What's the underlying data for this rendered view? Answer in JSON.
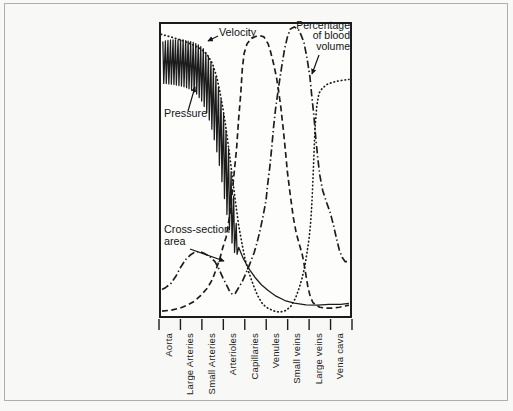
{
  "figure": {
    "ink_color": "#1c1c1c",
    "paper_color": "#f8f8f6",
    "frame_color": "#adadab"
  },
  "annotations": {
    "velocity": "Velocity",
    "pressure": "Pressure",
    "cross_section": "Cross-section\narea",
    "blood_volume": "Percentage\nof blood\nvolume"
  },
  "chart_data": {
    "type": "line",
    "title": "",
    "xlabel": "",
    "ylabel": "",
    "ink": "#1c1c1c",
    "grid": false,
    "legend": "inline text labels with arrows",
    "x_axis": {
      "categories": [
        "Aorta",
        "Large Arteries",
        "Small Arteries",
        "Arterioles",
        "Capillaries",
        "Venules",
        "Small veins",
        "Large veins",
        "Vena cava"
      ],
      "tick_style": "boundary ticks below axis, labels rotated 90deg reading bottom-to-top"
    },
    "y_axis": {
      "range": [
        0,
        100
      ],
      "note": "relative scale, no numeric ticks shown in figure"
    },
    "series": [
      {
        "name": "Velocity",
        "datakey": "velocity",
        "style": "dotted",
        "points": [
          [
            0,
            96.5
          ],
          [
            0.5,
            95.5
          ],
          [
            1,
            94.4
          ],
          [
            1.5,
            92.9
          ],
          [
            1.9,
            91.5
          ],
          [
            2.2,
            89.5
          ],
          [
            2.45,
            86.5
          ],
          [
            2.65,
            82
          ],
          [
            2.8,
            77
          ],
          [
            2.95,
            71
          ],
          [
            3.1,
            64
          ],
          [
            3.25,
            56
          ],
          [
            3.4,
            47.5
          ],
          [
            3.55,
            39
          ],
          [
            3.7,
            31
          ],
          [
            3.85,
            25
          ],
          [
            4,
            19.5
          ],
          [
            4.2,
            14.5
          ],
          [
            4.4,
            10.5
          ],
          [
            4.6,
            7
          ],
          [
            4.85,
            4
          ],
          [
            5.1,
            2.6
          ],
          [
            5.4,
            1.7
          ],
          [
            5.65,
            1.3
          ],
          [
            5.95,
            1.9
          ],
          [
            6.2,
            3.5
          ],
          [
            6.4,
            6
          ],
          [
            6.55,
            9
          ],
          [
            6.7,
            12.5
          ],
          [
            6.85,
            17
          ],
          [
            6.95,
            21.5
          ],
          [
            7.05,
            26.5
          ],
          [
            7.12,
            31.5
          ],
          [
            7.18,
            38
          ],
          [
            7.22,
            44
          ],
          [
            7.26,
            51
          ],
          [
            7.3,
            58
          ],
          [
            7.34,
            65
          ],
          [
            7.42,
            72
          ],
          [
            7.52,
            76.3
          ],
          [
            7.68,
            78
          ],
          [
            7.9,
            79.3
          ],
          [
            8.15,
            80
          ],
          [
            8.45,
            80.5
          ],
          [
            8.95,
            81
          ]
        ]
      },
      {
        "name": "Pressure",
        "datakey": "pressure",
        "style": "solid-oscillating",
        "spikes": 30,
        "envelope_top": [
          [
            0.09,
            94
          ],
          [
            0.5,
            94.6
          ],
          [
            1,
            94.6
          ],
          [
            1.5,
            93.8
          ],
          [
            1.8,
            92.8
          ],
          [
            2.05,
            91.3
          ],
          [
            2.25,
            89
          ],
          [
            2.45,
            86
          ],
          [
            2.6,
            82.5
          ],
          [
            2.75,
            78
          ],
          [
            2.9,
            72.5
          ],
          [
            3.05,
            66
          ],
          [
            3.2,
            58.5
          ],
          [
            3.3,
            52
          ],
          [
            3.42,
            44
          ],
          [
            3.52,
            36.5
          ],
          [
            3.62,
            28.5
          ],
          [
            3.7,
            23.5
          ]
        ],
        "envelope_bottom": [
          [
            0.09,
            79.7
          ],
          [
            0.5,
            79.4
          ],
          [
            1,
            78.7
          ],
          [
            1.4,
            77.7
          ],
          [
            1.7,
            76
          ],
          [
            1.95,
            73.5
          ],
          [
            2.15,
            70.3
          ],
          [
            2.35,
            66
          ],
          [
            2.52,
            61
          ],
          [
            2.68,
            55.5
          ],
          [
            2.82,
            50
          ],
          [
            2.95,
            43.5
          ],
          [
            3.1,
            36.5
          ],
          [
            3.25,
            30
          ],
          [
            3.38,
            25
          ],
          [
            3.5,
            21.8
          ],
          [
            3.65,
            21
          ],
          [
            3.7,
            22.5
          ]
        ],
        "tail": [
          [
            3.7,
            23.5
          ],
          [
            3.9,
            20
          ],
          [
            4.1,
            17.3
          ],
          [
            4.25,
            15.5
          ],
          [
            4.5,
            13
          ],
          [
            4.78,
            10.7
          ],
          [
            5.1,
            8.7
          ],
          [
            5.48,
            6.8
          ],
          [
            5.9,
            5.3
          ],
          [
            6.35,
            4.4
          ],
          [
            6.9,
            3.8
          ],
          [
            7.45,
            3.7
          ],
          [
            8,
            4
          ],
          [
            8.55,
            4
          ],
          [
            8.95,
            4.3
          ]
        ]
      },
      {
        "name": "Cross-section area",
        "datakey": "cross-section-area",
        "style": "dashed",
        "points": [
          [
            0.05,
            1.7
          ],
          [
            0.5,
            2
          ],
          [
            0.9,
            2.7
          ],
          [
            1.25,
            3.7
          ],
          [
            1.6,
            5.1
          ],
          [
            1.9,
            7.1
          ],
          [
            2.2,
            9.5
          ],
          [
            2.45,
            12.5
          ],
          [
            2.6,
            15.5
          ],
          [
            2.8,
            19.6
          ],
          [
            2.95,
            23.6
          ],
          [
            3.1,
            27
          ],
          [
            3.3,
            35.8
          ],
          [
            3.45,
            46.6
          ],
          [
            3.6,
            57.4
          ],
          [
            3.7,
            67.6
          ],
          [
            3.8,
            76.4
          ],
          [
            3.87,
            84.5
          ],
          [
            3.96,
            90
          ],
          [
            4.1,
            93.2
          ],
          [
            4.3,
            95
          ],
          [
            4.5,
            95.7
          ],
          [
            4.7,
            96
          ],
          [
            4.9,
            95.6
          ],
          [
            5.1,
            93.2
          ],
          [
            5.22,
            90.5
          ],
          [
            5.36,
            86.5
          ],
          [
            5.5,
            81.8
          ],
          [
            5.6,
            77
          ],
          [
            5.7,
            72
          ],
          [
            5.83,
            63.5
          ],
          [
            5.93,
            56
          ],
          [
            6.02,
            49.3
          ],
          [
            6.16,
            41.2
          ],
          [
            6.3,
            33.8
          ],
          [
            6.44,
            28.4
          ],
          [
            6.58,
            24.7
          ],
          [
            6.72,
            21.3
          ],
          [
            6.81,
            18
          ],
          [
            6.9,
            14
          ],
          [
            7,
            9.8
          ],
          [
            7.1,
            6.8
          ],
          [
            7.23,
            4.7
          ],
          [
            7.37,
            3.7
          ],
          [
            7.56,
            3
          ],
          [
            7.85,
            2.7
          ],
          [
            8.16,
            2.7
          ],
          [
            8.5,
            3
          ],
          [
            8.77,
            3.4
          ],
          [
            8.95,
            3.7
          ]
        ]
      },
      {
        "name": "Percentage of blood volume",
        "datakey": "blood-volume",
        "style": "dashdot",
        "points": [
          [
            0.05,
            9.1
          ],
          [
            0.23,
            9.8
          ],
          [
            0.47,
            11.1
          ],
          [
            0.7,
            13.5
          ],
          [
            0.93,
            16.6
          ],
          [
            1.17,
            19.3
          ],
          [
            1.4,
            20.9
          ],
          [
            1.63,
            22
          ],
          [
            1.87,
            22
          ],
          [
            2.1,
            21.3
          ],
          [
            2.33,
            20.3
          ],
          [
            2.57,
            18.6
          ],
          [
            2.75,
            16.2
          ],
          [
            2.94,
            13.2
          ],
          [
            3.13,
            10.5
          ],
          [
            3.27,
            8.4
          ],
          [
            3.4,
            7.4
          ],
          [
            3.54,
            7.8
          ],
          [
            3.68,
            9.5
          ],
          [
            3.87,
            11.8
          ],
          [
            4.06,
            14.9
          ],
          [
            4.24,
            18
          ],
          [
            4.43,
            21.6
          ],
          [
            4.57,
            25
          ],
          [
            4.71,
            29.1
          ],
          [
            4.85,
            33.8
          ],
          [
            5,
            39.5
          ],
          [
            5.08,
            45
          ],
          [
            5.18,
            51
          ],
          [
            5.27,
            57.4
          ],
          [
            5.36,
            64.5
          ],
          [
            5.46,
            71.3
          ],
          [
            5.6,
            78.4
          ],
          [
            5.74,
            85.1
          ],
          [
            5.88,
            91.2
          ],
          [
            6.02,
            95.6
          ],
          [
            6.16,
            98.3
          ],
          [
            6.34,
            99
          ],
          [
            6.53,
            98.3
          ],
          [
            6.67,
            96.3
          ],
          [
            6.81,
            93.6
          ],
          [
            6.95,
            88.5
          ],
          [
            7.09,
            82.1
          ],
          [
            7.18,
            75.3
          ],
          [
            7.28,
            68.6
          ],
          [
            7.37,
            61.1
          ],
          [
            7.46,
            54.4
          ],
          [
            7.56,
            48.3
          ],
          [
            7.7,
            43
          ],
          [
            7.88,
            39
          ],
          [
            8.07,
            35.1
          ],
          [
            8.21,
            31.1
          ],
          [
            8.35,
            26.7
          ],
          [
            8.49,
            22.6
          ],
          [
            8.63,
            20
          ],
          [
            8.77,
            18.6
          ],
          [
            8.95,
            18.6
          ]
        ]
      }
    ]
  }
}
